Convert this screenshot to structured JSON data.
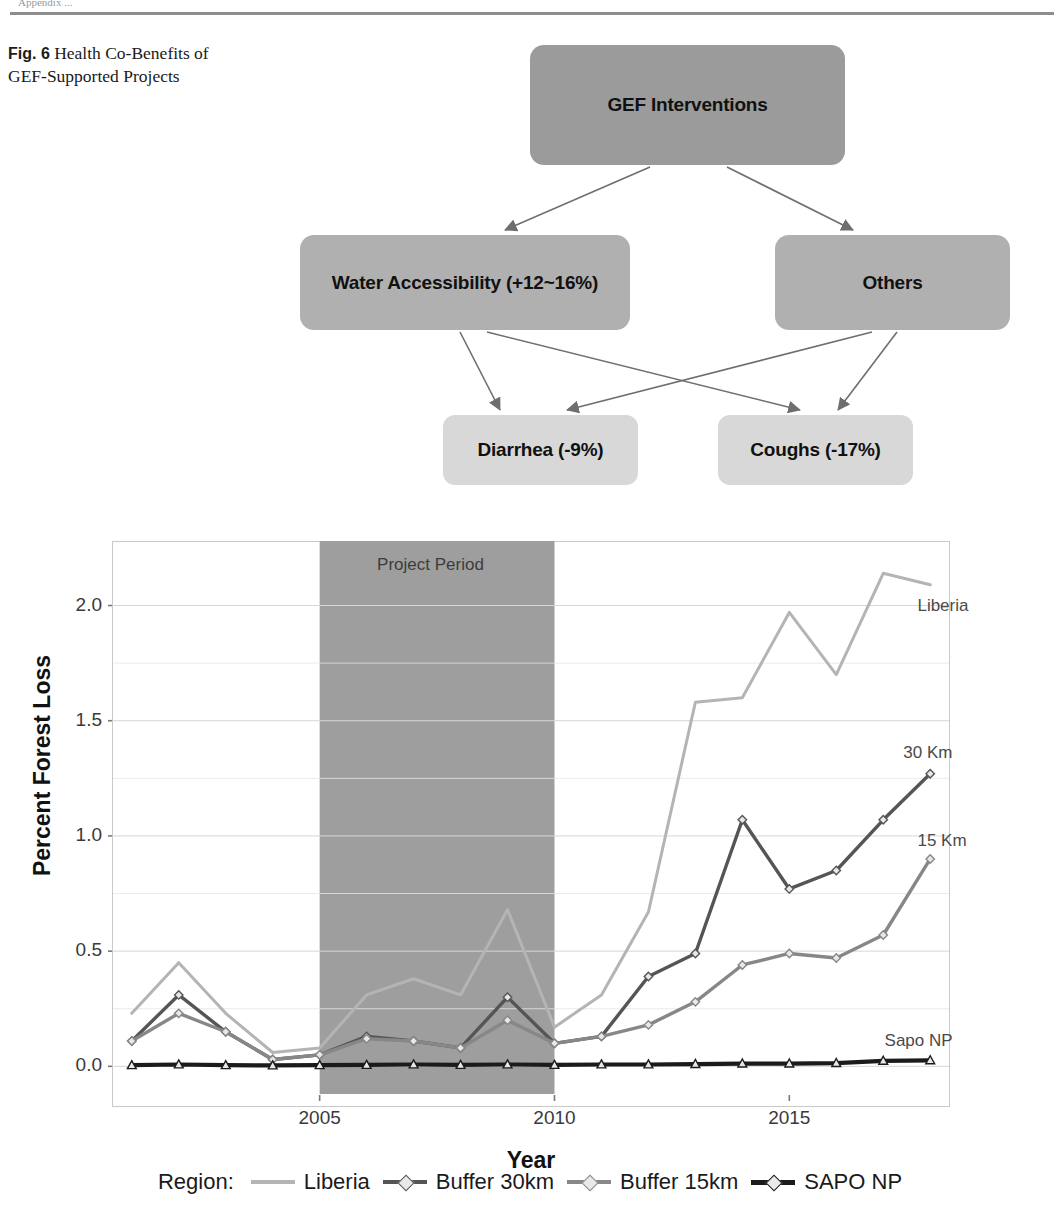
{
  "header": {
    "running_head": "Appendix ..."
  },
  "caption": {
    "fig_no": "Fig. 6",
    "text": "Health Co-Benefits of GEF-Supported Projects"
  },
  "diagram": {
    "nodes": [
      {
        "id": "gef",
        "label": "GEF Interventions",
        "color": "#9b9b9b"
      },
      {
        "id": "water",
        "label": "Water Accessibility (+12~16%)",
        "color": "#b0b0b0"
      },
      {
        "id": "others",
        "label": "Others",
        "color": "#b0b0b0"
      },
      {
        "id": "diarrhea",
        "label": "Diarrhea (-9%)",
        "color": "#d8d8d8"
      },
      {
        "id": "coughs",
        "label": "Coughs (-17%)",
        "color": "#d8d8d8"
      }
    ],
    "edges": [
      {
        "from": "gef",
        "to": "water"
      },
      {
        "from": "gef",
        "to": "others"
      },
      {
        "from": "water",
        "to": "diarrhea"
      },
      {
        "from": "water",
        "to": "coughs"
      },
      {
        "from": "others",
        "to": "diarrhea"
      },
      {
        "from": "others",
        "to": "coughs"
      }
    ]
  },
  "chart_data": {
    "type": "line",
    "title": "",
    "xlabel": "Year",
    "ylabel": "Percent Forest Loss",
    "xlim": [
      2000.6,
      2018.4
    ],
    "ylim": [
      -0.12,
      2.28
    ],
    "xticks": [
      "2005",
      "2010",
      "2015"
    ],
    "xtick_values": [
      2005,
      2010,
      2015
    ],
    "yticks": [
      "0.0",
      "0.5",
      "1.0",
      "1.5",
      "2.0"
    ],
    "ytick_values": [
      0.0,
      0.5,
      1.0,
      1.5,
      2.0
    ],
    "grid": "horizontal-light",
    "legend_position": "bottom",
    "legend_title": "Region:",
    "x": [
      2001,
      2002,
      2003,
      2004,
      2005,
      2006,
      2007,
      2008,
      2009,
      2010,
      2011,
      2012,
      2013,
      2014,
      2015,
      2016,
      2017,
      2018
    ],
    "series": [
      {
        "name": "Liberia",
        "legend_label": "Liberia",
        "inplot_label": "Liberia",
        "color": "#b4b4b4",
        "marker": "none",
        "values": [
          0.23,
          0.45,
          0.23,
          0.06,
          0.08,
          0.31,
          0.38,
          0.31,
          0.68,
          0.17,
          0.31,
          0.67,
          1.58,
          1.6,
          1.97,
          1.7,
          2.14,
          2.09
        ]
      },
      {
        "name": "Buffer 30km",
        "legend_label": "Buffer 30km",
        "inplot_label": "30 Km",
        "color": "#555555",
        "marker": "diamond",
        "values": [
          0.11,
          0.31,
          0.15,
          0.03,
          0.05,
          0.13,
          0.11,
          0.08,
          0.3,
          0.1,
          0.13,
          0.39,
          0.49,
          1.07,
          0.77,
          0.85,
          1.07,
          1.27
        ]
      },
      {
        "name": "Buffer 15km",
        "legend_label": "Buffer 15km",
        "inplot_label": "15 Km",
        "color": "#878787",
        "marker": "diamond",
        "values": [
          0.11,
          0.23,
          0.15,
          0.03,
          0.05,
          0.12,
          0.11,
          0.08,
          0.2,
          0.1,
          0.13,
          0.18,
          0.28,
          0.44,
          0.49,
          0.47,
          0.57,
          0.9
        ]
      },
      {
        "name": "SAPO NP",
        "legend_label": "SAPO NP",
        "inplot_label": "Sapo NP",
        "color": "#1b1b1b",
        "marker": "triangle",
        "values": [
          0.005,
          0.008,
          0.005,
          0.004,
          0.005,
          0.006,
          0.008,
          0.006,
          0.008,
          0.006,
          0.008,
          0.008,
          0.01,
          0.012,
          0.012,
          0.014,
          0.024,
          0.026
        ]
      }
    ],
    "annotations": [
      {
        "name": "project-period",
        "label": "Project Period",
        "x_start": 2005,
        "x_end": 2010,
        "color": "#9e9e9e"
      }
    ]
  }
}
